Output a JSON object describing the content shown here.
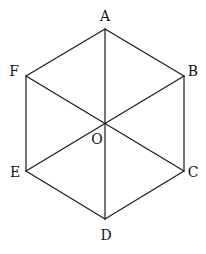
{
  "diagram": {
    "vertices": {
      "A": {
        "label": "A",
        "x": 105,
        "y": 29,
        "lx": 105,
        "ly": 21
      },
      "B": {
        "label": "B",
        "x": 184,
        "y": 76,
        "lx": 193,
        "ly": 76
      },
      "C": {
        "label": "C",
        "x": 184,
        "y": 171,
        "lx": 193,
        "ly": 177
      },
      "D": {
        "label": "D",
        "x": 105,
        "y": 219,
        "lx": 106,
        "ly": 240
      },
      "E": {
        "label": "E",
        "x": 26,
        "y": 171,
        "lx": 15,
        "ly": 177
      },
      "F": {
        "label": "F",
        "x": 26,
        "y": 76,
        "lx": 14,
        "ly": 76
      },
      "O": {
        "label": "O",
        "x": 105,
        "y": 124,
        "lx": 97,
        "ly": 144
      }
    },
    "edges": [
      [
        "A",
        "B"
      ],
      [
        "B",
        "C"
      ],
      [
        "C",
        "D"
      ],
      [
        "D",
        "E"
      ],
      [
        "E",
        "F"
      ],
      [
        "F",
        "A"
      ],
      [
        "A",
        "D"
      ],
      [
        "B",
        "E"
      ],
      [
        "F",
        "C"
      ]
    ],
    "stroke_color": "#1a1a1a"
  }
}
